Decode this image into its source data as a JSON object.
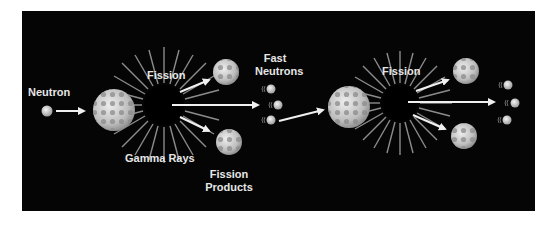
{
  "diagram": {
    "labels": {
      "neutron": "Neutron",
      "fission_1": "Fission",
      "gamma_rays": "Gamma Rays",
      "fast_neutrons_line1": "Fast",
      "fast_neutrons_line2": "Neutrons",
      "fission_products_line1": "Fission",
      "fission_products_line2": "Products",
      "fission_2": "Fission"
    },
    "colors": {
      "background": "#050505",
      "label": "#e6e6e6",
      "arrow": "#f0f0f0",
      "nucleus": "#c8c8c8",
      "nucleus_dark": "#8a8a8a",
      "ray": "#8c8c8c"
    }
  }
}
